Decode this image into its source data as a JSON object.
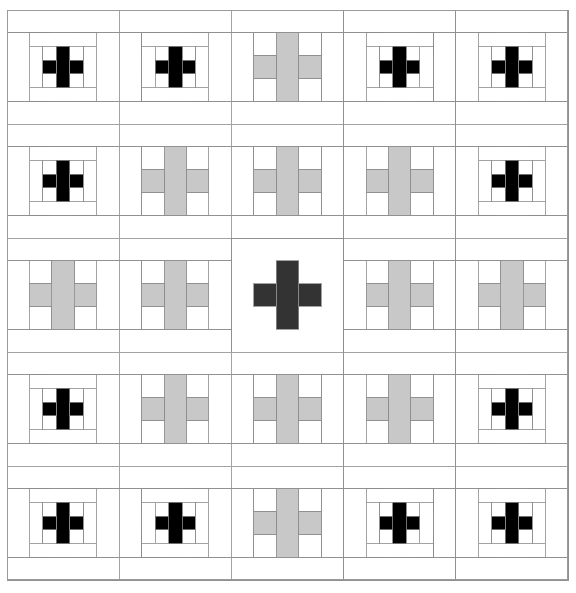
{
  "figure": {
    "type": "recursive-geometric-pattern",
    "canvas": {
      "width": 576,
      "height": 593,
      "background": "#ffffff"
    },
    "frame": {
      "x": 7,
      "y": 10,
      "width": 561,
      "height": 570,
      "stroke": "#9a9a9a",
      "stroke_width": 1,
      "fill": "#ffffff"
    },
    "colors": {
      "background": "#ffffff",
      "line": "#8c8c8c",
      "cross_dark": "#333333",
      "cross_gray": "#c8c8c8",
      "cross_black": "#000000",
      "frame_stroke": "#9a9a9a"
    },
    "grid": {
      "rows": 5,
      "cols": 5,
      "cell_width": 112.2,
      "cell_height": 114.0,
      "origin_x": 7,
      "origin_y": 10
    },
    "construction": {
      "rule": "Each square cell is subdivided 5x5; the central plus (cross) of 3x3 sub-cells is filled; the rule recurses into the cell at decreasing depth outward from the centre.",
      "depths": [
        [
          3,
          3,
          2,
          3,
          3
        ],
        [
          3,
          2,
          2,
          2,
          3
        ],
        [
          2,
          2,
          0,
          2,
          2
        ],
        [
          3,
          2,
          2,
          2,
          3
        ],
        [
          3,
          3,
          2,
          3,
          3
        ]
      ],
      "depth_note": "depth 0 = centre dark cross drawn directly; depth 2 and 3 = number of recursive subdivisions before the cross is painted"
    },
    "elements": [
      {
        "name": "center-dark-cross",
        "color": "#333333",
        "count": 1,
        "row": 3,
        "col": 3
      },
      {
        "name": "gray-cross",
        "color": "#c8c8c8",
        "count": 8,
        "ring": "inner"
      },
      {
        "name": "black-cross-small",
        "color": "#000000",
        "count": 16,
        "ring": "outer"
      }
    ]
  },
  "chart_data": {
    "type": "heatmap",
    "xlabel": "",
    "ylabel": "",
    "categories": [
      "col1",
      "col2",
      "col3",
      "col4",
      "col5"
    ],
    "rows": [
      "row1",
      "row2",
      "row3",
      "row4",
      "row5"
    ],
    "legend": [
      "dark cross #333333",
      "gray cross #c8c8c8",
      "black cross #000000",
      "white #ffffff"
    ],
    "grid": true,
    "values": [
      [
        3,
        3,
        2,
        3,
        3
      ],
      [
        3,
        2,
        2,
        2,
        3
      ],
      [
        2,
        2,
        0,
        2,
        2
      ],
      [
        3,
        2,
        2,
        2,
        3
      ],
      [
        3,
        3,
        2,
        3,
        3
      ]
    ]
  }
}
